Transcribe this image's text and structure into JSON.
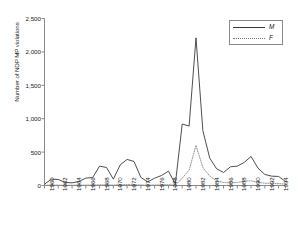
{
  "chart_data": {
    "type": "line",
    "title": "",
    "xlabel": "",
    "ylabel": "Number of NDP MP violations",
    "xlim": [
      1960,
      1995
    ],
    "ylim": [
      0,
      2500
    ],
    "grid": false,
    "legend_position": "top-right",
    "y_ticks": [
      0,
      500,
      1000,
      1500,
      2000,
      2500
    ],
    "y_tick_labels": [
      "0",
      "500",
      "1,000",
      "1,500",
      "2,000",
      "2,500"
    ],
    "x_tick_labels": [
      "1960",
      "1962",
      "1964",
      "1966",
      "1968",
      "1970",
      "1972",
      "1974",
      "1976",
      "1978",
      "1980",
      "1982",
      "1984",
      "1986",
      "1988",
      "1990",
      "1992",
      "1994"
    ],
    "x_minor_years": [
      1960,
      1961,
      1962,
      1963,
      1964,
      1965,
      1966,
      1967,
      1968,
      1969,
      1970,
      1971,
      1972,
      1973,
      1974,
      1975,
      1976,
      1977,
      1978,
      1979,
      1980,
      1981,
      1982,
      1983,
      1984,
      1985,
      1986,
      1987,
      1988,
      1989,
      1990,
      1991,
      1992,
      1993,
      1994,
      1995
    ],
    "x": [
      1960,
      1961,
      1962,
      1963,
      1964,
      1965,
      1966,
      1967,
      1968,
      1969,
      1970,
      1971,
      1972,
      1973,
      1974,
      1975,
      1976,
      1977,
      1978,
      1979,
      1980,
      1981,
      1982,
      1983,
      1984,
      1985,
      1986,
      1987,
      1988,
      1989,
      1990,
      1991,
      1992,
      1993,
      1994,
      1995
    ],
    "series": [
      {
        "name": "M",
        "style": "solid",
        "color": "#3a3a3a",
        "values": [
          20,
          95,
          90,
          45,
          40,
          60,
          110,
          120,
          290,
          270,
          95,
          310,
          390,
          360,
          120,
          55,
          110,
          150,
          215,
          20,
          920,
          890,
          2210,
          820,
          410,
          250,
          195,
          280,
          290,
          345,
          435,
          260,
          165,
          140,
          135,
          60
        ]
      },
      {
        "name": "F",
        "style": "dotted",
        "color": "#8a8a8a",
        "values": [
          5,
          6,
          5,
          4,
          4,
          5,
          6,
          7,
          10,
          9,
          6,
          12,
          14,
          12,
          8,
          5,
          7,
          9,
          12,
          5,
          110,
          230,
          600,
          270,
          140,
          70,
          45,
          40,
          45,
          65,
          70,
          45,
          35,
          30,
          28,
          20
        ]
      }
    ]
  },
  "legend": {
    "entries": [
      {
        "label": "M",
        "style": "solid"
      },
      {
        "label": "F",
        "style": "dotted"
      }
    ]
  },
  "axes": {
    "y_title": "Number of NDP MP violations"
  }
}
